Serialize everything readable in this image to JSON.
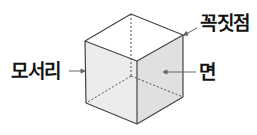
{
  "diagram": {
    "type": "cube-parts",
    "labels": {
      "edge": "모서리",
      "vertex": "꼭짓점",
      "face": "면"
    },
    "colors": {
      "line": "#444444",
      "hidden_line": "#555555",
      "top_face": "#ffffff",
      "left_face": "#ececec",
      "right_face": "#e0e0e0",
      "text": "#111111"
    }
  }
}
